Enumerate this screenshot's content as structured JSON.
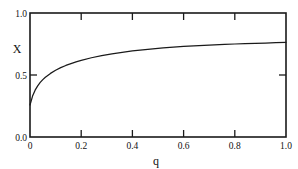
{
  "figure": {
    "background_color": "#ffffff",
    "line_color": "#1a1a1a",
    "text_color": "#111111"
  },
  "axis": {
    "x_title": "q",
    "y_title": "X",
    "x_tick_labels": [
      "0",
      "0.2",
      "0.4",
      "0.6",
      "0.8",
      "1.0"
    ],
    "y_tick_labels": [
      "0.0",
      "0.5",
      "1.0"
    ]
  },
  "chart_data": {
    "type": "line",
    "title": "",
    "subtitle": "",
    "xlabel": "q",
    "ylabel": "X",
    "xlim": [
      0,
      1.0
    ],
    "ylim": [
      0.0,
      1.0
    ],
    "xticks": [
      0,
      0.2,
      0.4,
      0.6,
      0.8,
      1.0
    ],
    "xticklabels": [
      "0",
      "0.2",
      "0.4",
      "0.6",
      "0.8",
      "1.0"
    ],
    "yticks": [
      0.0,
      0.5,
      1.0
    ],
    "yticklabels": [
      "0.0",
      "0.5",
      "1.0"
    ],
    "minor_yticks": [],
    "grid": false,
    "legend": null,
    "legend_position": "none",
    "tick_direction": "in",
    "frame": "full-box",
    "annotations": [],
    "series": [
      {
        "name": "X(q)",
        "color": "#1a1a1a",
        "linewidth": 1.25,
        "x": [
          0.0,
          0.01,
          0.02,
          0.03,
          0.04,
          0.05,
          0.06,
          0.08,
          0.1,
          0.12,
          0.14,
          0.16,
          0.18,
          0.2,
          0.24,
          0.28,
          0.32,
          0.36,
          0.4,
          0.44,
          0.48,
          0.52,
          0.56,
          0.6,
          0.64,
          0.68,
          0.72,
          0.76,
          0.8,
          0.84,
          0.88,
          0.92,
          0.96,
          1.0
        ],
        "y": [
          0.258,
          0.33,
          0.378,
          0.412,
          0.44,
          0.463,
          0.482,
          0.513,
          0.538,
          0.559,
          0.577,
          0.592,
          0.606,
          0.618,
          0.639,
          0.656,
          0.671,
          0.683,
          0.694,
          0.703,
          0.711,
          0.718,
          0.724,
          0.73,
          0.735,
          0.739,
          0.743,
          0.747,
          0.75,
          0.753,
          0.756,
          0.758,
          0.761,
          0.763
        ]
      }
    ]
  }
}
